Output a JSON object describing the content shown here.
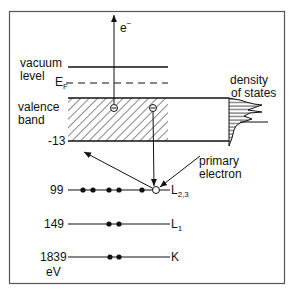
{
  "colors": {
    "ink": "#111111",
    "frame": "#555555",
    "background": "#ffffff"
  },
  "labels": {
    "electron_out": "e",
    "electron_out_sup": "−",
    "vacuum_level_1": "vacuum",
    "vacuum_level_2": "level",
    "fermi": "E",
    "fermi_sub": "F",
    "valence_band_1": "valence",
    "valence_band_2": "band",
    "band_bottom": "-13",
    "density_of_states_1": "density",
    "density_of_states_2": "of states",
    "primary_electron_1": "primary",
    "primary_electron_2": "electron",
    "unit": "eV"
  },
  "levels": [
    {
      "energy": "99",
      "name": "L",
      "sub": "2,3",
      "electrons": 5,
      "holes": 1
    },
    {
      "energy": "149",
      "name": "L",
      "sub": "1",
      "electrons": 2,
      "holes": 0
    },
    {
      "energy": "1839",
      "name": "K",
      "sub": "",
      "electrons": 2,
      "holes": 0
    }
  ]
}
